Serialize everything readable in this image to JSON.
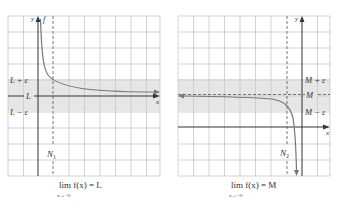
{
  "panels": [
    {
      "id": "left",
      "y_axis_label": "y",
      "x_axis_label": "x",
      "function_label": "f",
      "band_upper_label": "L + ε",
      "center_label": "L",
      "band_lower_label": "L − ε",
      "threshold_label": "N",
      "threshold_sub": "1",
      "caption_main": "lim f(x) = L",
      "caption_sub": "x→+∞"
    },
    {
      "id": "right",
      "y_axis_label": "y",
      "x_axis_label": "x",
      "band_upper_label": "M + ε",
      "center_label": "M",
      "band_lower_label": "M − ε",
      "threshold_label": "N",
      "threshold_sub": "2",
      "caption_main": "lim f(x) = M",
      "caption_sub": "x→−∞"
    }
  ],
  "colors": {
    "grid": "#c8c8c8",
    "band": "#e6e6e6",
    "axis": "#333333",
    "curve": "#777777"
  }
}
